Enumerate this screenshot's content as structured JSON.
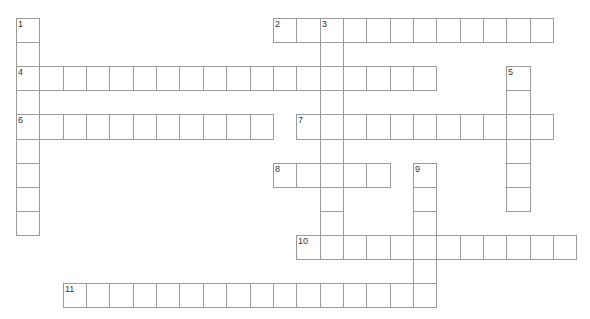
{
  "puzzle": {
    "grid_origin": {
      "x": 16,
      "y": 18
    },
    "cell_size": {
      "w": 23.35,
      "h": 24.1
    },
    "line_color": "#9a9a9a",
    "words": [
      {
        "number": 1,
        "direction": "down",
        "row": 0,
        "col": 0,
        "length": 9
      },
      {
        "number": 2,
        "direction": "across",
        "row": 0,
        "col": 11,
        "length": 12
      },
      {
        "number": 3,
        "direction": "down",
        "row": 0,
        "col": 13,
        "length": 10
      },
      {
        "number": 4,
        "direction": "across",
        "row": 2,
        "col": 0,
        "length": 18
      },
      {
        "number": 5,
        "direction": "down",
        "row": 2,
        "col": 21,
        "length": 6
      },
      {
        "number": 6,
        "direction": "across",
        "row": 4,
        "col": 0,
        "length": 11
      },
      {
        "number": 7,
        "direction": "across",
        "row": 4,
        "col": 12,
        "length": 11
      },
      {
        "number": 8,
        "direction": "across",
        "row": 6,
        "col": 11,
        "length": 5
      },
      {
        "number": 9,
        "direction": "down",
        "row": 6,
        "col": 17,
        "length": 6
      },
      {
        "number": 10,
        "direction": "across",
        "row": 9,
        "col": 12,
        "length": 12
      },
      {
        "number": 11,
        "direction": "across",
        "row": 11,
        "col": 2,
        "length": 16
      }
    ]
  }
}
